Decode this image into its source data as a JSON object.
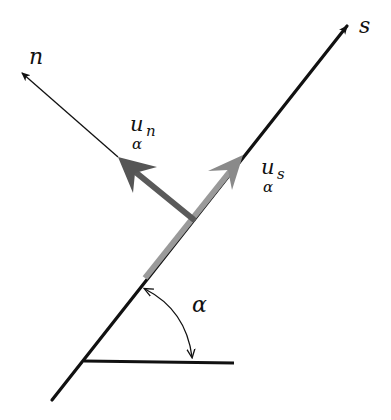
{
  "diagram": {
    "labels": {
      "s_axis": "s",
      "n_axis": "n",
      "un_main": "u",
      "un_sub": "n",
      "un_below": "α",
      "us_main": "u",
      "us_sub": "s",
      "us_below": "α",
      "angle": "α"
    },
    "colors": {
      "line": "#111111",
      "us_arrow": "#8a8a8a",
      "un_arrow": "#5a5a5a",
      "gray_segment": "#9a9a9a",
      "background": "#ffffff"
    },
    "elements": [
      {
        "name": "s-axis",
        "type": "arrow",
        "from": [
          52,
          400
        ],
        "to": [
          350,
          22
        ]
      },
      {
        "name": "n-axis",
        "type": "arrow",
        "from": [
          193,
          219
        ],
        "to": [
          19,
          70
        ]
      },
      {
        "name": "u-n-component",
        "type": "thick-arrow",
        "from": [
          193,
          219
        ],
        "to": [
          118,
          157
        ]
      },
      {
        "name": "u-s-component",
        "type": "thick-arrow",
        "from": [
          145,
          278
        ],
        "to": [
          243,
          155
        ]
      },
      {
        "name": "horizontal-reference",
        "type": "line",
        "from": [
          84,
          361
        ],
        "to": [
          234,
          363
        ]
      },
      {
        "name": "angle-arc",
        "type": "double-arrow-arc",
        "from": [
          143,
          288
        ],
        "to": [
          192,
          360
        ]
      }
    ]
  }
}
